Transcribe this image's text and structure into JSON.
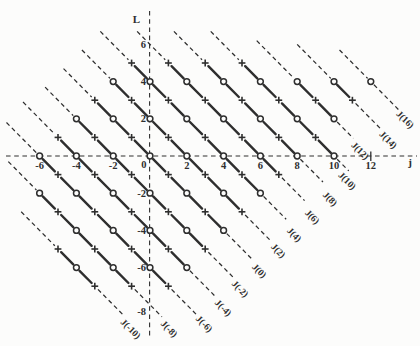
{
  "figure": {
    "bg": "#fcfcfb",
    "ink": "#2e2e2e",
    "width": 420,
    "height": 346
  },
  "chart_data": {
    "type": "scatter",
    "title": "",
    "xlabel": "j",
    "ylabel": "L",
    "xlim": [
      -7.8,
      14.5
    ],
    "ylim": [
      -10.2,
      7.9
    ],
    "grid": false,
    "axis_style": "dashed axes crossing at origin",
    "marker_rule": "open circle where L is even, plus sign where L is odd; all markers lie on diagonals J = j + L (solid between markers, dashed tails)",
    "x_ticks": [
      {
        "v": -6,
        "label": "-6"
      },
      {
        "v": -4,
        "label": "-4"
      },
      {
        "v": -2,
        "label": "-2"
      },
      {
        "v": 2,
        "label": "2"
      },
      {
        "v": 4,
        "label": "4"
      },
      {
        "v": 6,
        "label": "6"
      },
      {
        "v": 8,
        "label": "8"
      },
      {
        "v": 10,
        "label": "10"
      },
      {
        "v": 12,
        "label": "12",
        "tick_mark": true
      }
    ],
    "y_ticks": [
      {
        "v": 6,
        "label": "6",
        "dy": 0
      },
      {
        "v": 4,
        "label": "4",
        "dy": 0
      },
      {
        "v": 2,
        "label": "2",
        "dy": 0
      },
      {
        "v": -2,
        "label": "-2",
        "dy": 0
      },
      {
        "v": -4,
        "label": "-4",
        "dy": 0
      },
      {
        "v": -6,
        "label": "-6",
        "dy": 0
      },
      {
        "v": -8,
        "label": "-8",
        "dy": 6.5
      }
    ],
    "origin_label": "0",
    "series": [
      {
        "label": "J(16)",
        "J": 16,
        "points": [
          [
            12,
            4
          ]
        ],
        "lead": 1.7,
        "trail": 1.5,
        "label_at": [
          13.75,
          2.0
        ]
      },
      {
        "label": "J(14)",
        "J": 14,
        "points": [
          [
            10,
            4
          ],
          [
            11,
            3
          ]
        ],
        "lead": 2.0,
        "trail": 1.55,
        "label_at": [
          12.83,
          0.91
        ]
      },
      {
        "label": "J(12)",
        "J": 12,
        "points": [
          [
            8,
            4
          ],
          [
            9,
            3
          ],
          [
            10,
            2
          ]
        ],
        "lead": 2.2,
        "trail": 1.05,
        "label_at": [
          11.3,
          0.32
        ]
      },
      {
        "label": "J(10)",
        "J": 10,
        "points": [
          [
            5,
            5
          ],
          [
            6,
            4
          ],
          [
            7,
            3
          ],
          [
            8,
            2
          ],
          [
            9,
            1
          ],
          [
            10,
            0
          ]
        ],
        "lead": 1.7,
        "trail": 0.8,
        "label_at": [
          10.6,
          -1.29
        ]
      },
      {
        "label": "J(8)",
        "J": 8,
        "points": [
          [
            3,
            5
          ],
          [
            4,
            4
          ],
          [
            5,
            3
          ],
          [
            6,
            2
          ],
          [
            7,
            1
          ],
          [
            8,
            0
          ]
        ],
        "lead": 1.7,
        "trail": 1.4,
        "label_at": [
          9.67,
          -2.26
        ]
      },
      {
        "label": "J(6)",
        "J": 6,
        "points": [
          [
            1,
            5
          ],
          [
            2,
            4
          ],
          [
            3,
            3
          ],
          [
            4,
            2
          ],
          [
            5,
            1
          ],
          [
            6,
            0
          ],
          [
            7,
            -1
          ]
        ],
        "lead": 1.7,
        "trail": 1.4,
        "label_at": [
          8.7,
          -3.23
        ]
      },
      {
        "label": "J(4)",
        "J": 4,
        "points": [
          [
            -1,
            5
          ],
          [
            0,
            4
          ],
          [
            1,
            3
          ],
          [
            2,
            2
          ],
          [
            3,
            1
          ],
          [
            4,
            0
          ],
          [
            5,
            -1
          ],
          [
            6,
            -2
          ]
        ],
        "lead": 1.7,
        "trail": 1.4,
        "label_at": [
          7.72,
          -4.19
        ]
      },
      {
        "label": "J(2)",
        "J": 2,
        "points": [
          [
            -2,
            4
          ],
          [
            -1,
            3
          ],
          [
            0,
            2
          ],
          [
            1,
            1
          ],
          [
            2,
            0
          ],
          [
            3,
            -1
          ],
          [
            4,
            -2
          ],
          [
            5,
            -3
          ]
        ],
        "lead": 1.7,
        "trail": 1.5,
        "label_at": [
          6.85,
          -5.05
        ]
      },
      {
        "label": "J(0)",
        "J": 0,
        "points": [
          [
            -3,
            3
          ],
          [
            -2,
            2
          ],
          [
            -1,
            1
          ],
          [
            0,
            0
          ],
          [
            1,
            -1
          ],
          [
            2,
            -2
          ],
          [
            3,
            -3
          ],
          [
            4,
            -4
          ]
        ],
        "lead": 1.7,
        "trail": 1.5,
        "label_at": [
          5.82,
          -6.13
        ]
      },
      {
        "label": "J(-2)",
        "J": -2,
        "points": [
          [
            -4,
            2
          ],
          [
            -3,
            1
          ],
          [
            -2,
            0
          ],
          [
            -1,
            -1
          ],
          [
            0,
            -2
          ],
          [
            1,
            -3
          ],
          [
            2,
            -4
          ],
          [
            3,
            -5
          ]
        ],
        "lead": 1.7,
        "trail": 1.5,
        "label_at": [
          4.78,
          -7.1
        ]
      },
      {
        "label": "J(-4)",
        "J": -4,
        "points": [
          [
            -5,
            1
          ],
          [
            -4,
            0
          ],
          [
            -3,
            -1
          ],
          [
            -2,
            -2
          ],
          [
            -1,
            -3
          ],
          [
            0,
            -4
          ],
          [
            1,
            -5
          ],
          [
            2,
            -6
          ]
        ],
        "lead": 1.9,
        "trail": 1.5,
        "label_at": [
          3.86,
          -8.12
        ]
      },
      {
        "label": "J(-6)",
        "J": -6,
        "points": [
          [
            -6,
            0
          ],
          [
            -5,
            -1
          ],
          [
            -4,
            -2
          ],
          [
            -3,
            -3
          ],
          [
            -2,
            -4
          ],
          [
            -1,
            -5
          ],
          [
            0,
            -6
          ],
          [
            1,
            -7
          ]
        ],
        "lead": 1.8,
        "trail": 1.5,
        "label_at": [
          2.83,
          -8.98
        ]
      },
      {
        "label": "J(-8)",
        "J": -8,
        "points": [
          [
            -6,
            -2
          ],
          [
            -5,
            -3
          ],
          [
            -4,
            -4
          ],
          [
            -3,
            -5
          ],
          [
            -2,
            -6
          ],
          [
            -1,
            -7
          ]
        ],
        "lead": 1.7,
        "trail": 1.65,
        "label_at": [
          0.92,
          -9.25
        ]
      },
      {
        "label": "J(-10)",
        "J": -10,
        "points": [
          [
            -5,
            -5
          ],
          [
            -4,
            -6
          ],
          [
            -3,
            -7
          ]
        ],
        "lead": 2.0,
        "trail": 1.55,
        "label_at": [
          -1.17,
          -9.25
        ]
      }
    ]
  }
}
